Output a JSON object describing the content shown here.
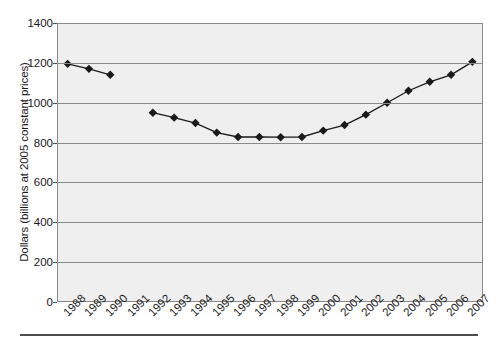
{
  "chart_data": {
    "type": "line",
    "title": "",
    "subtitle": "",
    "xlabel": "",
    "ylabel": "Dollars (billions at 2005 constant prices)",
    "categories": [
      "1988",
      "1989",
      "1990",
      "1991",
      "1992",
      "1993",
      "1994",
      "1995",
      "1996",
      "1997",
      "1998",
      "1999",
      "2000",
      "2001",
      "2002",
      "2003",
      "2004",
      "2005",
      "2006",
      "2007"
    ],
    "values": [
      1195,
      1170,
      1140,
      null,
      950,
      925,
      898,
      850,
      828,
      828,
      827,
      828,
      860,
      888,
      940,
      1000,
      1060,
      1105,
      1140,
      1205
    ],
    "series": [
      {
        "name": "Dollars (billions at 2005 constant prices)",
        "values": [
          1195,
          1170,
          1140,
          null,
          950,
          925,
          898,
          850,
          828,
          828,
          827,
          828,
          860,
          888,
          940,
          1000,
          1060,
          1105,
          1140,
          1205
        ]
      }
    ],
    "ylim": [
      0,
      1400
    ],
    "y_ticks": [
      0,
      200,
      400,
      600,
      800,
      1000,
      1200,
      1400
    ],
    "y_tick_labels": [
      "0",
      "200",
      "400",
      "600",
      "800",
      "1000",
      "1200",
      "1400"
    ],
    "x_tick_labels": [
      "1988",
      "1989",
      "1990",
      "1991",
      "1992",
      "1993",
      "1994",
      "1995",
      "1996",
      "1997",
      "1998",
      "1999",
      "2000",
      "2001",
      "2002",
      "2003",
      "2004",
      "2005",
      "2006",
      "2007"
    ],
    "grid": true,
    "legend": false,
    "legend_position": "none",
    "marker": "diamond",
    "annotations": [
      "No data point plotted for 1991 (gap in the line)"
    ],
    "colors": {
      "plot_background": "#efefef",
      "gridline": "#8a8a8a",
      "axis": "#8a8a8a",
      "series_line": "#1a1a1a",
      "marker_fill": "#1a1a1a",
      "text": "#1a1a1a",
      "bottom_rule": "#4d4d4d",
      "page_background": "#ffffff"
    }
  }
}
